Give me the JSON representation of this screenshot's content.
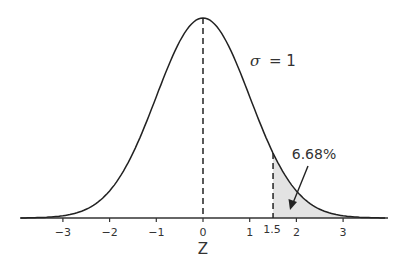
{
  "chart_data": {
    "type": "area",
    "title": "",
    "xlabel": "Z",
    "ylabel": "",
    "distribution": "standard normal",
    "sigma_label": "σ = 1",
    "sigma_symbol": "σ",
    "sigma_value": "= 1",
    "mean": 0,
    "sd": 1,
    "xlim": [
      -3.9,
      3.9
    ],
    "x_ticks": [
      -3,
      -2,
      -1,
      0,
      1,
      1.5,
      2,
      3
    ],
    "x_tick_labels": [
      "−3",
      "−2",
      "−1",
      "0",
      "1",
      "1.5",
      "2",
      "3"
    ],
    "shaded_region": {
      "from": 1.5,
      "to": 3.9,
      "label": "6.68%",
      "color": "#e3e3e3"
    },
    "reference_lines": [
      {
        "x": 0,
        "style": "dashed",
        "to": "peak"
      },
      {
        "x": 1.5,
        "style": "dashed",
        "to": "curve"
      }
    ],
    "grid": false,
    "legend": null,
    "annotation": {
      "text": "6.68%",
      "arrow_to": "shaded tail area"
    }
  }
}
